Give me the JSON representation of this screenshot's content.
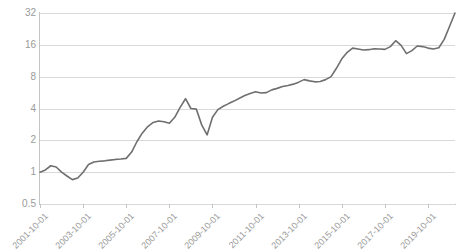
{
  "chart_data": {
    "type": "line",
    "title": "",
    "xlabel": "",
    "ylabel": "",
    "yscale": "log2",
    "ylim": [
      0.5,
      32
    ],
    "ytick_labels": [
      "32",
      "16",
      "8",
      "4",
      "2",
      "1",
      "0.5"
    ],
    "ytick_values": [
      32,
      16,
      8,
      4,
      2,
      1,
      0.5
    ],
    "xtick_labels": [
      "2001-10-01",
      "2003-10-01",
      "2005-10-01",
      "2007-10-01",
      "2009-10-01",
      "2011-10-01",
      "2013-10-01",
      "2015-10-01",
      "2017-10-01",
      "2019-10-01"
    ],
    "grid": true,
    "legend": false,
    "legend_position": "none",
    "line_color": "#6f6f6f",
    "grid_color": "#d9d9d9",
    "axis_color": "#c4c4c4",
    "tick_label_color": "#9a9a9a",
    "series": [
      {
        "name": "Index",
        "x": [
          "2001-10-01",
          "2002-01-01",
          "2002-04-01",
          "2002-07-01",
          "2002-10-01",
          "2003-01-01",
          "2003-04-01",
          "2003-07-01",
          "2003-10-01",
          "2004-01-01",
          "2004-04-01",
          "2004-07-01",
          "2004-10-01",
          "2005-01-01",
          "2005-04-01",
          "2005-07-01",
          "2005-10-01",
          "2006-01-01",
          "2006-04-01",
          "2006-07-01",
          "2006-10-01",
          "2007-01-01",
          "2007-04-01",
          "2007-07-01",
          "2007-10-01",
          "2008-01-01",
          "2008-04-01",
          "2008-07-01",
          "2008-10-01",
          "2009-01-01",
          "2009-04-01",
          "2009-07-01",
          "2009-10-01",
          "2010-01-01",
          "2010-04-01",
          "2010-07-01",
          "2010-10-01",
          "2011-01-01",
          "2011-04-01",
          "2011-07-01",
          "2011-10-01",
          "2012-01-01",
          "2012-04-01",
          "2012-07-01",
          "2012-10-01",
          "2013-01-01",
          "2013-04-01",
          "2013-07-01",
          "2013-10-01",
          "2014-01-01",
          "2014-04-01",
          "2014-07-01",
          "2014-10-01",
          "2015-01-01",
          "2015-04-01",
          "2015-07-01",
          "2015-10-01",
          "2016-01-01",
          "2016-04-01",
          "2016-07-01",
          "2016-10-01",
          "2017-01-01",
          "2017-04-01",
          "2017-07-01",
          "2017-10-01",
          "2018-01-01",
          "2018-04-01",
          "2018-07-01",
          "2018-10-01",
          "2019-01-01",
          "2019-04-01",
          "2019-07-01",
          "2019-10-01",
          "2020-01-01",
          "2020-04-01",
          "2020-07-01",
          "2020-10-01",
          "2021-01-01"
        ],
        "values": [
          1.0,
          1.05,
          1.15,
          1.12,
          1.0,
          0.92,
          0.85,
          0.88,
          1.0,
          1.18,
          1.25,
          1.27,
          1.28,
          1.3,
          1.32,
          1.33,
          1.35,
          1.55,
          1.95,
          2.35,
          2.7,
          2.95,
          3.05,
          3.0,
          2.9,
          3.3,
          4.1,
          4.95,
          4.0,
          3.95,
          2.8,
          2.25,
          3.3,
          3.9,
          4.2,
          4.45,
          4.7,
          5.0,
          5.3,
          5.55,
          5.75,
          5.6,
          5.65,
          6.0,
          6.2,
          6.45,
          6.6,
          6.8,
          7.1,
          7.5,
          7.3,
          7.15,
          7.2,
          7.5,
          8.0,
          9.6,
          11.8,
          13.6,
          14.9,
          14.6,
          14.3,
          14.4,
          14.7,
          14.6,
          14.5,
          15.4,
          17.5,
          15.8,
          13.2,
          14.1,
          15.6,
          15.4,
          14.9,
          14.6,
          15.0,
          18.0,
          24.0,
          32.0
        ]
      }
    ]
  },
  "axis": {
    "y_label_32": "32",
    "y_label_16": "16",
    "y_label_8": "8",
    "y_label_4": "4",
    "y_label_2": "2",
    "y_label_1": "1",
    "y_label_05": "0.5"
  }
}
